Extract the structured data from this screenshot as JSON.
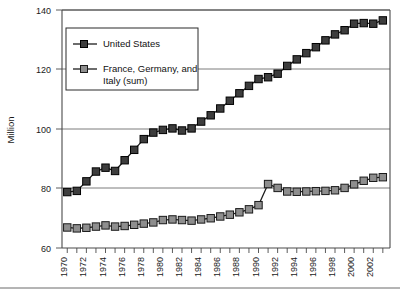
{
  "chart_data": {
    "type": "line",
    "title": "",
    "xlabel": "",
    "ylabel": "Million",
    "ylim": [
      60,
      140
    ],
    "xlim": [
      1970,
      2003
    ],
    "yticks": [
      60,
      80,
      100,
      120,
      140
    ],
    "grid": true,
    "legend_position": "top-left-inside",
    "x": [
      1970,
      1971,
      1972,
      1973,
      1974,
      1975,
      1976,
      1977,
      1978,
      1979,
      1980,
      1981,
      1982,
      1983,
      1984,
      1985,
      1986,
      1987,
      1988,
      1989,
      1990,
      1991,
      1992,
      1993,
      1994,
      1995,
      1996,
      1997,
      1998,
      1999,
      2000,
      2001,
      2002,
      2003
    ],
    "xtick_labels": [
      "1970",
      "1972",
      "1974",
      "1976",
      "1978",
      "1980",
      "1982",
      "1984",
      "1986",
      "1988",
      "1990",
      "1992",
      "1994",
      "1996",
      "1998",
      "2000",
      "2002"
    ],
    "series": [
      {
        "name": "United States",
        "marker": "square-dark",
        "values": [
          78.8,
          79.2,
          82.4,
          85.7,
          87.0,
          85.9,
          89.5,
          93.0,
          96.6,
          98.8,
          99.7,
          100.2,
          99.5,
          100.2,
          102.5,
          104.6,
          106.9,
          109.5,
          112.0,
          114.5,
          116.8,
          117.4,
          118.6,
          121.2,
          123.4,
          125.5,
          127.5,
          129.8,
          131.8,
          133.2,
          135.4,
          135.6,
          135.4,
          136.5
        ]
      },
      {
        "name": "France, Germany, and Italy (sum)",
        "marker": "square-gray",
        "values": [
          66.9,
          66.6,
          66.8,
          67.2,
          67.6,
          67.2,
          67.4,
          67.8,
          68.2,
          68.6,
          69.4,
          69.6,
          69.4,
          69.2,
          69.6,
          70.0,
          70.6,
          71.2,
          72.0,
          73.0,
          74.4,
          81.5,
          80.2,
          79.0,
          78.9,
          79.0,
          79.1,
          79.2,
          79.4,
          80.2,
          81.4,
          82.6,
          83.6,
          83.8
        ]
      }
    ],
    "legend_entries": [
      "United States",
      "France, Germany, and Italy (sum)"
    ],
    "legend_line1": "France, Germany, and",
    "legend_line2": "Italy (sum)"
  },
  "colors": {
    "us_marker": "#3d3d3d",
    "eu_marker": "#8e8e8e",
    "line": "#1c1c1c",
    "grid": "#6e6e6e",
    "frame": "#3a3a3a",
    "background": "#ffffff"
  }
}
